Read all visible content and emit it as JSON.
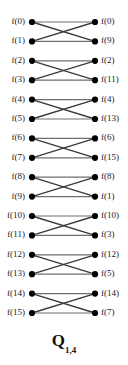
{
  "figure": {
    "type": "butterfly-network-diagram",
    "caption": {
      "symbol": "Q",
      "subscript": "1,4"
    },
    "node_count_per_column": 16,
    "node_color": "#000000",
    "edge_color": "#3a3a3a",
    "background": "#ffffff",
    "left_column": {
      "name": "input-nodes",
      "labels": [
        "f(0)",
        "f(1)",
        "f(2)",
        "f(3)",
        "f(4)",
        "f(5)",
        "f(6)",
        "f(7)",
        "f(8)",
        "f(9)",
        "f(10)",
        "f(11)",
        "f(12)",
        "f(13)",
        "f(14)",
        "f(15)"
      ],
      "indices": [
        0,
        1,
        2,
        3,
        4,
        5,
        6,
        7,
        8,
        9,
        10,
        11,
        12,
        13,
        14,
        15
      ]
    },
    "right_column": {
      "name": "output-nodes",
      "labels": [
        "f(0)",
        "f(9)",
        "f(2)",
        "f(11)",
        "f(4)",
        "f(13)",
        "f(6)",
        "f(15)",
        "f(8)",
        "f(1)",
        "f(10)",
        "f(3)",
        "f(12)",
        "f(5)",
        "f(14)",
        "f(7)"
      ],
      "indices": [
        0,
        9,
        2,
        11,
        4,
        13,
        6,
        15,
        8,
        1,
        10,
        3,
        12,
        5,
        14,
        7
      ]
    },
    "geometry": {
      "left_x": 32,
      "right_x": 95,
      "first_y": 22,
      "row_spacing": 19.4,
      "node_radius": 3.1
    },
    "edges": [
      [
        0,
        0
      ],
      [
        0,
        9
      ],
      [
        1,
        0
      ],
      [
        1,
        9
      ],
      [
        2,
        2
      ],
      [
        2,
        11
      ],
      [
        3,
        2
      ],
      [
        3,
        11
      ],
      [
        4,
        4
      ],
      [
        4,
        13
      ],
      [
        5,
        4
      ],
      [
        5,
        13
      ],
      [
        6,
        6
      ],
      [
        6,
        15
      ],
      [
        7,
        6
      ],
      [
        7,
        15
      ],
      [
        8,
        8
      ],
      [
        8,
        1
      ],
      [
        9,
        8
      ],
      [
        9,
        1
      ],
      [
        10,
        10
      ],
      [
        10,
        3
      ],
      [
        11,
        10
      ],
      [
        11,
        3
      ],
      [
        12,
        12
      ],
      [
        12,
        5
      ],
      [
        13,
        12
      ],
      [
        13,
        5
      ],
      [
        14,
        14
      ],
      [
        14,
        7
      ],
      [
        15,
        14
      ],
      [
        15,
        7
      ]
    ]
  }
}
